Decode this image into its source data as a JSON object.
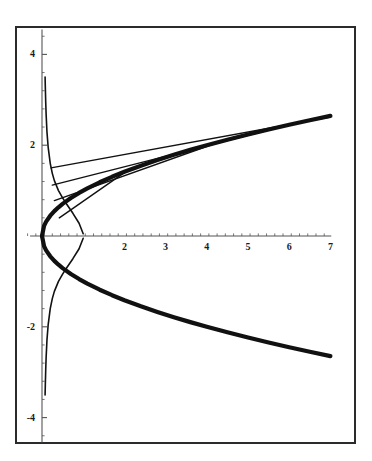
{
  "figure": {
    "title": "",
    "background_color": "#ffffff",
    "frame_color": "#2b2b2b",
    "curve_color": "#111111"
  },
  "chart_data": {
    "type": "line",
    "title": "",
    "subtitle": "",
    "xlabel": "",
    "ylabel": "",
    "xlim": [
      -0.35,
      7.3
    ],
    "ylim": [
      -4.6,
      4.6
    ],
    "grid": false,
    "legend_position": "none",
    "axis_style": "cross-axes-with-ticks",
    "x_ticks": [
      1,
      2,
      3,
      4,
      5,
      6,
      7
    ],
    "x_tick_labels": [
      "",
      "2",
      "3",
      "4",
      "5",
      "6",
      "7"
    ],
    "y_ticks": [
      -4,
      -2,
      2,
      4
    ],
    "y_tick_labels": [
      "-4",
      "-2",
      "2",
      "4"
    ],
    "x_minor_tick_step": 0.2,
    "y_minor_tick_step": 0.4,
    "series": [
      {
        "name": "y = sqrt(x)",
        "style": "thick",
        "linewidth": 4.2,
        "color": "#111111",
        "x": [
          0,
          0.05,
          0.1,
          0.2,
          0.3,
          0.4,
          0.5,
          0.7,
          0.9,
          1.1,
          1.4,
          1.7,
          2,
          2.4,
          2.8,
          3.2,
          3.6,
          4,
          4.5,
          5,
          5.5,
          6,
          6.5,
          7
        ],
        "y": [
          0,
          0.224,
          0.316,
          0.447,
          0.548,
          0.632,
          0.707,
          0.837,
          0.949,
          1.049,
          1.183,
          1.304,
          1.414,
          1.549,
          1.673,
          1.789,
          1.897,
          2,
          2.121,
          2.236,
          2.345,
          2.449,
          2.55,
          2.646
        ]
      },
      {
        "name": "y = -sqrt(x)",
        "style": "thick",
        "linewidth": 4.2,
        "color": "#111111",
        "x": [
          0,
          0.05,
          0.1,
          0.2,
          0.3,
          0.4,
          0.5,
          0.7,
          0.9,
          1.1,
          1.4,
          1.7,
          2,
          2.4,
          2.8,
          3.2,
          3.6,
          4,
          4.5,
          5,
          5.5,
          6,
          6.5,
          7
        ],
        "y": [
          0,
          -0.224,
          -0.316,
          -0.447,
          -0.548,
          -0.632,
          -0.707,
          -0.837,
          -0.949,
          -1.049,
          -1.183,
          -1.304,
          -1.414,
          -1.549,
          -1.673,
          -1.789,
          -1.897,
          -2,
          -2.121,
          -2.236,
          -2.345,
          -2.449,
          -2.55,
          -2.646
        ]
      },
      {
        "name": "thin branch upper",
        "style": "thin",
        "linewidth": 1.6,
        "color": "#111111",
        "x": [
          0.075,
          0.08,
          0.09,
          0.1,
          0.12,
          0.15,
          0.2,
          0.25,
          0.3,
          0.4,
          0.5,
          0.6,
          0.75,
          0.9,
          1.0
        ],
        "y": [
          3.5,
          3.3,
          2.95,
          2.68,
          2.3,
          1.95,
          1.6,
          1.38,
          1.22,
          1.0,
          0.84,
          0.7,
          0.5,
          0.28,
          0.05
        ]
      },
      {
        "name": "thin branch lower",
        "style": "thin",
        "linewidth": 1.6,
        "color": "#111111",
        "x": [
          0.075,
          0.08,
          0.09,
          0.1,
          0.12,
          0.15,
          0.2,
          0.25,
          0.3,
          0.4,
          0.5,
          0.6,
          0.75,
          0.9,
          1.0
        ],
        "y": [
          -3.5,
          -3.3,
          -2.95,
          -2.68,
          -2.3,
          -1.95,
          -1.6,
          -1.38,
          -1.22,
          -1.0,
          -0.84,
          -0.7,
          -0.5,
          -0.28,
          -0.05
        ]
      }
    ],
    "secant_lines": [
      {
        "name": "secant-1",
        "x0": 0.22,
        "y0": 1.5,
        "x1": 7.0,
        "y1": 2.62,
        "linewidth": 1.4,
        "color": "#111111"
      },
      {
        "name": "secant-2",
        "x0": 0.25,
        "y0": 1.12,
        "x1": 6.05,
        "y1": 2.46,
        "linewidth": 1.4,
        "color": "#111111"
      },
      {
        "name": "secant-3",
        "x0": 0.3,
        "y0": 0.78,
        "x1": 4.3,
        "y1": 2.07,
        "linewidth": 1.4,
        "color": "#111111"
      },
      {
        "name": "secant-4",
        "x0": 0.42,
        "y0": 0.4,
        "x1": 2.05,
        "y1": 1.43,
        "linewidth": 1.4,
        "color": "#111111"
      }
    ],
    "annotations": []
  }
}
